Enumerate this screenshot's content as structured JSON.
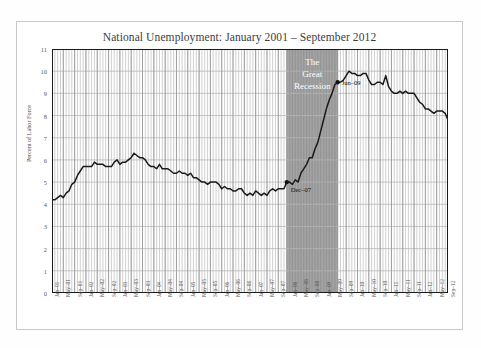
{
  "chart_data": {
    "type": "line",
    "title": "National Unemployment: January 2001 – September 2012",
    "xlabel": "",
    "ylabel": "Percent of Labor Force",
    "ylim": [
      0,
      11
    ],
    "ytick_values": [
      0,
      1,
      2,
      3,
      4,
      5,
      6,
      7,
      8,
      9,
      10,
      11
    ],
    "grid": true,
    "legend_position": "none",
    "x_start": "Jan-01",
    "x_end": "Sep-12",
    "xtick_labels": [
      "Jan–01",
      "May–01",
      "Sep–01",
      "Jan–02",
      "May–02",
      "Sep–02",
      "Jan–03",
      "May–03",
      "Sep–03",
      "Jan–04",
      "May–04",
      "Sep–04",
      "Jan–05",
      "May–05",
      "Sep–05",
      "Jan–06",
      "May–06",
      "Sep–06",
      "Jan–07",
      "May–07",
      "Sep–07",
      "Jan–08",
      "May–08",
      "Sep–08",
      "Jan–09",
      "May–09",
      "Sep–09",
      "Jan–10",
      "May–10",
      "Sep–10",
      "Jan–11",
      "May–11",
      "Sep–11",
      "Jan–12",
      "May–12",
      "Sep–12"
    ],
    "series": [
      {
        "name": "Unemployment Rate",
        "color": "#1a1a1a",
        "values": [
          4.2,
          4.2,
          4.3,
          4.4,
          4.3,
          4.5,
          4.6,
          4.9,
          5.0,
          5.3,
          5.5,
          5.7,
          5.7,
          5.7,
          5.7,
          5.9,
          5.8,
          5.8,
          5.8,
          5.7,
          5.7,
          5.7,
          5.9,
          6.0,
          5.8,
          5.9,
          5.9,
          6.0,
          6.1,
          6.3,
          6.2,
          6.1,
          6.1,
          6.0,
          5.8,
          5.7,
          5.7,
          5.6,
          5.8,
          5.6,
          5.6,
          5.6,
          5.5,
          5.4,
          5.4,
          5.5,
          5.4,
          5.4,
          5.3,
          5.4,
          5.2,
          5.2,
          5.1,
          5.0,
          5.0,
          4.9,
          5.0,
          5.0,
          5.0,
          4.9,
          4.7,
          4.8,
          4.7,
          4.7,
          4.6,
          4.6,
          4.7,
          4.7,
          4.5,
          4.4,
          4.5,
          4.4,
          4.6,
          4.5,
          4.4,
          4.5,
          4.4,
          4.6,
          4.7,
          4.6,
          4.7,
          4.7,
          4.7,
          5.0,
          5.0,
          4.9,
          5.1,
          5.0,
          5.4,
          5.6,
          5.8,
          6.1,
          6.1,
          6.5,
          6.8,
          7.3,
          7.8,
          8.3,
          8.7,
          9.0,
          9.4,
          9.5,
          9.5,
          9.6,
          9.8,
          10.0,
          9.9,
          9.9,
          9.8,
          9.8,
          9.9,
          9.9,
          9.6,
          9.4,
          9.4,
          9.5,
          9.5,
          9.4,
          9.8,
          9.3,
          9.1,
          9.0,
          9.0,
          9.1,
          9.0,
          9.1,
          9.0,
          9.0,
          9.0,
          8.8,
          8.6,
          8.5,
          8.3,
          8.3,
          8.2,
          8.1,
          8.2,
          8.2,
          8.2,
          8.1,
          7.8
        ]
      }
    ],
    "annotations": [
      {
        "text": "The Great Recession",
        "start": "Dec–07",
        "end": "Jun–09",
        "shade_color": "#a0a0a0"
      },
      {
        "text": "Dec–07",
        "value": 5.0
      },
      {
        "text": "Jun–09",
        "value": 9.5
      }
    ]
  },
  "recession_band": {
    "label_line1": "The",
    "label_line2": "Great",
    "label_line3": "Recession",
    "start_label": "Dec–07",
    "end_label": "Jun–09",
    "start_index": 83,
    "end_index": 101,
    "fill": "#a3a3a3"
  },
  "axes": {
    "line_color": "#1a1a1a",
    "grid_color": "#b8b8b8",
    "month_grid_color": "#c4c4c4"
  }
}
